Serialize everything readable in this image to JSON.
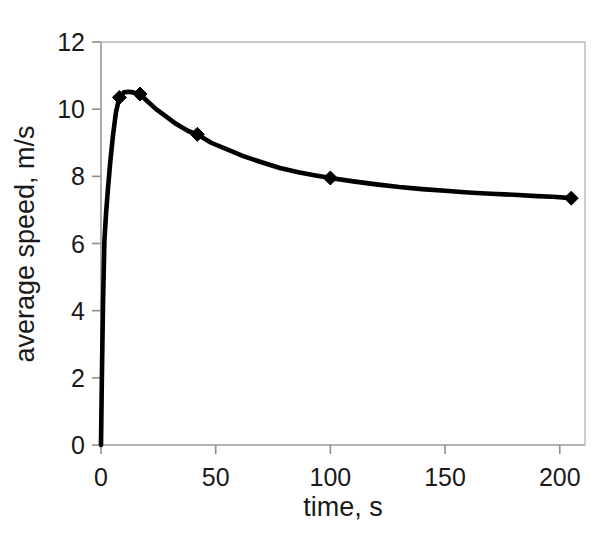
{
  "figure": {
    "background_color": "#ffffff",
    "series_color": "#000000",
    "axis_color": "#9a9a9a",
    "text_color": "#1a1a1a"
  },
  "chart_data": {
    "type": "line",
    "title": "",
    "subtitle": "",
    "xlabel": "time, s",
    "ylabel": "average speed, m/s",
    "xlim": [
      0,
      211
    ],
    "ylim": [
      0,
      12
    ],
    "xticks": [
      0,
      50,
      100,
      150,
      200
    ],
    "xtick_labels": [
      "0",
      "50",
      "100",
      "150",
      "200"
    ],
    "yticks": [
      0,
      2,
      4,
      6,
      8,
      10,
      12
    ],
    "ytick_labels": [
      "0",
      "2",
      "4",
      "6",
      "8",
      "10",
      "12"
    ],
    "grid": false,
    "legend": false,
    "legend_position": "none",
    "marker": "diamond",
    "series": [
      {
        "name": "average speed",
        "x": [
          0,
          0.4,
          0.9,
          1.5,
          2.2,
          3.0,
          4.0,
          5.2,
          6.5,
          8.0,
          10.0,
          12.0,
          14.0,
          17.0,
          20.0,
          24.0,
          28.0,
          33.0,
          38.0,
          42.0,
          48.0,
          55.0,
          62.0,
          70.0,
          78.0,
          86.0,
          93.0,
          100.0,
          110.0,
          120.0,
          130.0,
          140.0,
          150.0,
          160.0,
          170.0,
          180.0,
          190.0,
          197.0,
          205.0
        ],
        "y": [
          0.0,
          2.1,
          4.3,
          6.1,
          6.9,
          7.6,
          8.4,
          9.2,
          9.9,
          10.35,
          10.5,
          10.52,
          10.5,
          10.45,
          10.25,
          10.0,
          9.8,
          9.55,
          9.35,
          9.25,
          9.0,
          8.8,
          8.6,
          8.42,
          8.25,
          8.12,
          8.03,
          7.95,
          7.85,
          7.76,
          7.68,
          7.62,
          7.57,
          7.52,
          7.48,
          7.45,
          7.41,
          7.39,
          7.35
        ]
      }
    ],
    "marker_points": [
      {
        "x": 8.0,
        "y": 10.35
      },
      {
        "x": 17.0,
        "y": 10.45
      },
      {
        "x": 42.0,
        "y": 9.25
      },
      {
        "x": 100.0,
        "y": 7.95
      },
      {
        "x": 205.0,
        "y": 7.35
      }
    ]
  }
}
